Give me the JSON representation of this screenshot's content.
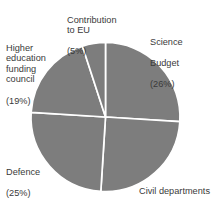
{
  "figure": {
    "clipped_header_fragment": "                    ",
    "background_color": "#ffffff",
    "slice_color": "#7d7d7d",
    "divider_color": "#ffffff",
    "label_color": "#3a3a3a"
  },
  "chart_data": {
    "type": "pie",
    "title": "",
    "xlabel": "",
    "ylabel": "",
    "grid": false,
    "legend_position": "outside-labels",
    "start_angle_deg": 0,
    "direction": "clockwise",
    "center": {
      "x": 105.5,
      "y": 117
    },
    "radius": 74.5,
    "units": "percent",
    "categories": [
      "Science Budget",
      "Civil departments",
      "Defence",
      "Higher education funding council",
      "Contribution to EU"
    ],
    "values": [
      26,
      25,
      25,
      19,
      5
    ],
    "slices": [
      {
        "name": "Science Budget",
        "label_line1": "Science",
        "label_line2": "Budget",
        "value": 26,
        "percent_text": "(26%)",
        "start_deg": 0,
        "end_deg": 93.6,
        "color": "#7d7d7d"
      },
      {
        "name": "Civil departments",
        "label_line1": "Civil departments",
        "label_line2": "",
        "value": 25,
        "percent_text": "(25%)",
        "start_deg": 93.6,
        "end_deg": 183.6,
        "color": "#7d7d7d"
      },
      {
        "name": "Defence",
        "label_line1": "Defence",
        "label_line2": "",
        "value": 25,
        "percent_text": "(25%)",
        "start_deg": 183.6,
        "end_deg": 273.6,
        "color": "#7d7d7d"
      },
      {
        "name": "Higher education funding council",
        "label_line1": "Higher\neducation\nfunding\ncouncil",
        "label_line2": "",
        "value": 19,
        "percent_text": "(19%)",
        "start_deg": 273.6,
        "end_deg": 342.0,
        "color": "#7d7d7d"
      },
      {
        "name": "Contribution to EU",
        "label_line1": "Contribution\nto EU",
        "label_line2": "",
        "value": 5,
        "percent_text": "(5%)",
        "start_deg": 342.0,
        "end_deg": 360.0,
        "color": "#7d7d7d"
      }
    ]
  }
}
